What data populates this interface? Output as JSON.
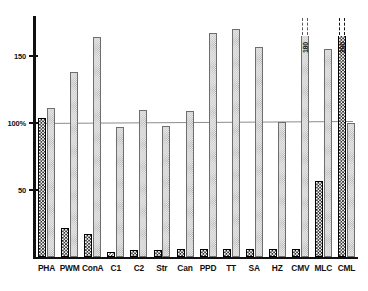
{
  "chart_data": {
    "type": "bar",
    "title": "",
    "xlabel": "",
    "ylabel": "",
    "ylim": [
      0,
      175
    ],
    "grid": false,
    "legend_position": "none",
    "reference_line": {
      "value": 100,
      "label": "100%"
    },
    "y_ticks": [
      {
        "value": 150,
        "label": "150"
      },
      {
        "value": 100,
        "label": "100%"
      },
      {
        "value": 50,
        "label": "50"
      }
    ],
    "categories": [
      "PHA",
      "PWM",
      "ConA",
      "C1",
      "C2",
      "Str",
      "Can",
      "PPD",
      "TT",
      "SA",
      "HZ",
      "CMV",
      "MLC",
      "CML"
    ],
    "series": [
      {
        "name": "checkered",
        "fill": "dark-checkerboard",
        "values": [
          104,
          22,
          17,
          4,
          5,
          5,
          6,
          6,
          6,
          6,
          6,
          6,
          57,
          200
        ],
        "overflow": [
          false,
          false,
          false,
          false,
          false,
          false,
          false,
          false,
          false,
          false,
          false,
          false,
          false,
          true
        ],
        "overflow_labels": [
          "",
          "",
          "",
          "",
          "",
          "",
          "",
          "",
          "",
          "",
          "",
          "",
          "",
          "200"
        ]
      },
      {
        "name": "dotted",
        "fill": "light-stipple",
        "values": [
          111,
          138,
          164,
          97,
          110,
          98,
          109,
          167,
          170,
          157,
          101,
          180,
          155,
          100
        ],
        "overflow": [
          false,
          false,
          false,
          false,
          false,
          false,
          false,
          false,
          false,
          false,
          false,
          true,
          false,
          false
        ],
        "overflow_labels": [
          "",
          "",
          "",
          "",
          "",
          "",
          "",
          "",
          "",
          "",
          "",
          "180",
          "",
          ""
        ]
      }
    ],
    "colors": {
      "axis": "#111111",
      "reference_line": "#8b8b8b",
      "dark_bar_fill": "#1b1b1b",
      "light_bar_fill": "#e7e7e7",
      "background": "#ffffff"
    }
  },
  "corner": {
    "mark": ""
  }
}
